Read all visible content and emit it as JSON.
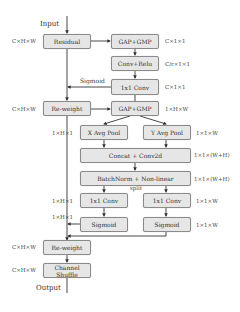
{
  "diagram": {
    "input_label": "Input",
    "output_label": "Output",
    "sigmoid_label": "Sigmoid",
    "split_label": "split",
    "boxes": {
      "residual": "Residual",
      "gap_gmp_1": "GAP+GMP",
      "conv_relu": "Conv+Relu",
      "conv1x1_top": "1x1 Conv",
      "reweight_1": "Re-weight",
      "gap_gmp_2": "GAP+GMP",
      "x_avg_pool": "X Avg Pool",
      "y_avg_pool": "Y Avg Pool",
      "concat_conv2d": "Concat + Conv2d",
      "batchnorm": "BatchNorm + Non-linear",
      "conv1x1_left": "1x1 Conv",
      "conv1x1_right": "1x1 Conv",
      "sigmoid_left": "Sigmoid",
      "sigmoid_right": "Sigmoid",
      "reweight_2": "Re-weight",
      "channel_shuffle": "Channel Shuffle"
    },
    "dims": {
      "residual": "C×H×W",
      "gap_gmp_1": "C×1×1",
      "conv_relu": "C/r×1×1",
      "conv1x1_top": "C×1×1",
      "reweight_1": "C×H×W",
      "gap_gmp_2": "1×H×W",
      "x_avg_pool": "1×H×1",
      "y_avg_pool": "1×1×W",
      "concat_conv2d": "1×1×(W+H)",
      "batchnorm": "1×1×(W+H)",
      "conv1x1_left": "1×H×1",
      "conv1x1_right": "1×1×W",
      "sigmoid_left": "1×H×1",
      "sigmoid_right": "1×1×W",
      "reweight_2": "C×H×W",
      "channel_shuffle": "C×H×W"
    }
  }
}
